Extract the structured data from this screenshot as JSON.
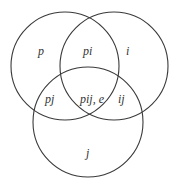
{
  "diagram": {
    "type": "venn",
    "stroke_color": "#3a3a3a",
    "background": "#ffffff",
    "circles": [
      {
        "name": "p",
        "cx": 65,
        "cy": 66,
        "r": 54
      },
      {
        "name": "i",
        "cx": 114,
        "cy": 66,
        "r": 54
      },
      {
        "name": "j",
        "cx": 88,
        "cy": 122,
        "r": 55
      }
    ],
    "regions": {
      "p": "p",
      "pi": "pi",
      "i": "i",
      "pj": "pj",
      "pij": "pij, e",
      "ij": "ij",
      "j": "j"
    }
  }
}
